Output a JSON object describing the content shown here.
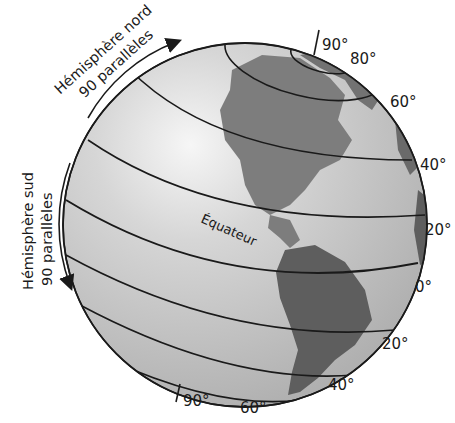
{
  "diagram": {
    "colors": {
      "ocean": "#c9c9c9",
      "ocean_highlight": "#f2f2f2",
      "land": "#7a7a7a",
      "land_dark": "#5c5c5c",
      "lines": "#1a1a1a",
      "background": "#ffffff"
    },
    "north_annotation": {
      "line1": "Hémisphère nord",
      "line2": "90 parallèles",
      "arrow": "arrow-up-right-icon"
    },
    "south_annotation": {
      "line1": "Hémisphère sud",
      "line2": "90 parallèles",
      "arrow": "arrow-down-icon"
    },
    "equator_label": "Équateur",
    "latitude_labels": {
      "n90": "90°",
      "n80": "80°",
      "n60": "60°",
      "n40": "40°",
      "n20": "20°",
      "eq0": "0°",
      "s20": "20°",
      "s40": "40°",
      "s60": "60°",
      "s90": "90°"
    }
  }
}
